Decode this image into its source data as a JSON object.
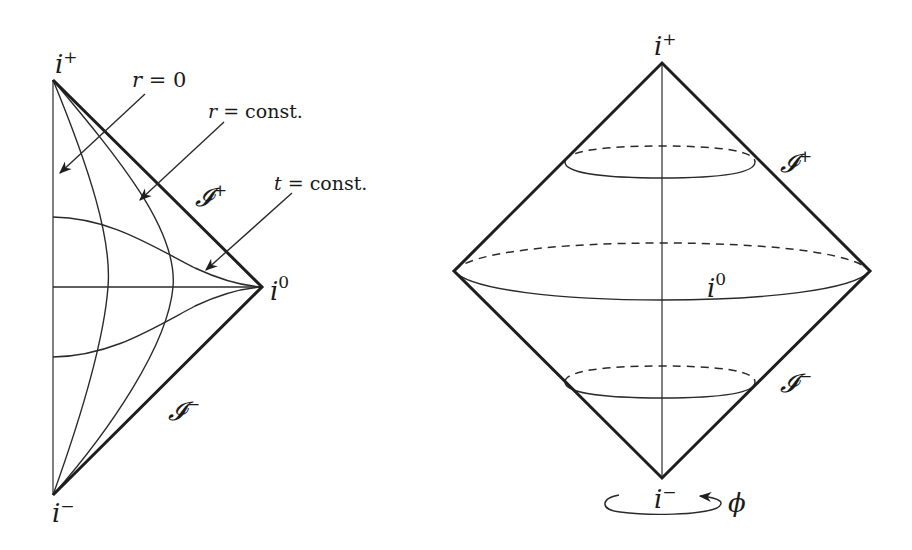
{
  "figure": {
    "left_panel": {
      "title": "Penrose diagram of Minkowski space (r ≥ 0 half)",
      "labels": {
        "i_plus": {
          "base": "i",
          "sup": "+"
        },
        "i_zero": {
          "base": "i",
          "sup": "0"
        },
        "i_minus": {
          "base": "i",
          "sup": "−"
        },
        "scri_plus": {
          "base": "𝓘",
          "sup": "+"
        },
        "scri_minus": {
          "base": "𝓘",
          "sup": "−"
        },
        "r_zero": {
          "var": "r",
          "rest": " = 0"
        },
        "r_const": {
          "var": "r",
          "rest": " = const."
        },
        "t_const": {
          "var": "t",
          "rest": " = const."
        }
      }
    },
    "right_panel": {
      "title": "Penrose diagram with angular direction restored",
      "labels": {
        "i_plus": {
          "base": "i",
          "sup": "+"
        },
        "i_zero": {
          "base": "i",
          "sup": "0"
        },
        "i_minus": {
          "base": "i",
          "sup": "−"
        },
        "scri_plus": {
          "base": "𝓘",
          "sup": "+"
        },
        "scri_minus": {
          "base": "𝓘",
          "sup": "−"
        },
        "phi": "ϕ"
      }
    },
    "colors": {
      "ink": "#1e1e1e",
      "background": "#ffffff"
    }
  }
}
